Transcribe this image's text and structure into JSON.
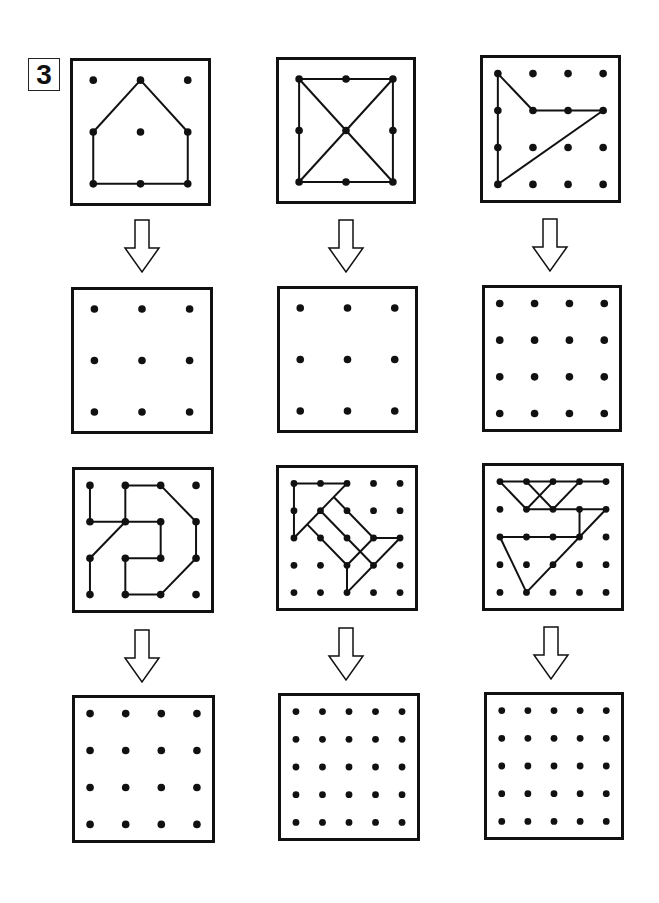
{
  "exercise": {
    "number": "3",
    "type": "geoboard copy exercise",
    "instructions_icon": "down-arrow-icon"
  },
  "colors": {
    "line": "#111111",
    "dot": "#111111",
    "background": "#ffffff"
  },
  "panels": [
    {
      "id": "source-1",
      "x": 70,
      "y": 58,
      "w": 141,
      "h": 148,
      "grid": 3,
      "lines": [
        [
          [
            1,
            0
          ],
          [
            0,
            1
          ]
        ],
        [
          [
            1,
            0
          ],
          [
            2,
            1
          ]
        ],
        [
          [
            0,
            1
          ],
          [
            0,
            2
          ]
        ],
        [
          [
            2,
            1
          ],
          [
            2,
            2
          ]
        ],
        [
          [
            0,
            2
          ],
          [
            2,
            2
          ]
        ]
      ]
    },
    {
      "id": "source-2",
      "x": 276,
      "y": 57,
      "w": 140,
      "h": 147,
      "grid": 3,
      "lines": [
        [
          [
            0,
            0
          ],
          [
            2,
            0
          ]
        ],
        [
          [
            0,
            0
          ],
          [
            0,
            2
          ]
        ],
        [
          [
            2,
            0
          ],
          [
            2,
            2
          ]
        ],
        [
          [
            0,
            2
          ],
          [
            2,
            2
          ]
        ],
        [
          [
            0,
            0
          ],
          [
            2,
            2
          ]
        ],
        [
          [
            2,
            0
          ],
          [
            0,
            2
          ]
        ]
      ]
    },
    {
      "id": "source-3",
      "x": 480,
      "y": 55,
      "w": 141,
      "h": 148,
      "grid": 4,
      "lines": [
        [
          [
            0,
            0
          ],
          [
            0,
            3
          ]
        ],
        [
          [
            0,
            0
          ],
          [
            1,
            1
          ]
        ],
        [
          [
            1,
            1
          ],
          [
            3,
            1
          ]
        ],
        [
          [
            3,
            1
          ],
          [
            0,
            3
          ]
        ]
      ]
    },
    {
      "id": "target-1",
      "x": 71,
      "y": 287,
      "w": 142,
      "h": 147,
      "grid": 3,
      "lines": []
    },
    {
      "id": "target-2",
      "x": 277,
      "y": 286,
      "w": 141,
      "h": 147,
      "grid": 3,
      "lines": []
    },
    {
      "id": "target-3",
      "x": 482,
      "y": 285,
      "w": 140,
      "h": 147,
      "grid": 4,
      "lines": []
    },
    {
      "id": "source-4",
      "x": 72,
      "y": 467,
      "w": 142,
      "h": 146,
      "grid": 4,
      "lines": [
        [
          [
            0,
            0
          ],
          [
            0,
            1
          ]
        ],
        [
          [
            0,
            1
          ],
          [
            2,
            1
          ]
        ],
        [
          [
            1,
            0
          ],
          [
            1,
            1
          ]
        ],
        [
          [
            1,
            0
          ],
          [
            2,
            0
          ]
        ],
        [
          [
            2,
            0
          ],
          [
            3,
            1
          ]
        ],
        [
          [
            3,
            1
          ],
          [
            3,
            2
          ]
        ],
        [
          [
            3,
            2
          ],
          [
            2,
            3
          ]
        ],
        [
          [
            2,
            3
          ],
          [
            1,
            3
          ]
        ],
        [
          [
            1,
            3
          ],
          [
            1,
            2
          ]
        ],
        [
          [
            1,
            2
          ],
          [
            2,
            2
          ]
        ],
        [
          [
            2,
            2
          ],
          [
            2,
            1
          ]
        ],
        [
          [
            1,
            1
          ],
          [
            0,
            2
          ]
        ],
        [
          [
            0,
            2
          ],
          [
            0,
            3
          ]
        ]
      ]
    },
    {
      "id": "source-5",
      "x": 276,
      "y": 465,
      "w": 142,
      "h": 146,
      "grid": 5,
      "lines": [
        [
          [
            0,
            0
          ],
          [
            2,
            0
          ]
        ],
        [
          [
            0,
            0
          ],
          [
            0,
            2
          ]
        ],
        [
          [
            0,
            2
          ],
          [
            2,
            0
          ]
        ],
        [
          [
            1.5,
            0.5
          ],
          [
            3,
            2
          ]
        ],
        [
          [
            1,
            1
          ],
          [
            3,
            3
          ]
        ],
        [
          [
            0.5,
            1.5
          ],
          [
            2,
            3
          ]
        ],
        [
          [
            3,
            2
          ],
          [
            4,
            2
          ]
        ],
        [
          [
            3,
            2
          ],
          [
            2,
            3
          ]
        ],
        [
          [
            4,
            2
          ],
          [
            2,
            4
          ]
        ],
        [
          [
            2,
            3
          ],
          [
            2,
            4
          ]
        ]
      ]
    },
    {
      "id": "source-6",
      "x": 482,
      "y": 463,
      "w": 142,
      "h": 148,
      "grid": 5,
      "lines": [
        [
          [
            0,
            0
          ],
          [
            4,
            0
          ]
        ],
        [
          [
            0,
            0
          ],
          [
            1,
            1
          ]
        ],
        [
          [
            1,
            0
          ],
          [
            2,
            1
          ]
        ],
        [
          [
            2,
            0
          ],
          [
            1,
            1
          ]
        ],
        [
          [
            3,
            0
          ],
          [
            2,
            1
          ]
        ],
        [
          [
            1,
            1
          ],
          [
            4,
            1
          ]
        ],
        [
          [
            3,
            1
          ],
          [
            3,
            2
          ]
        ],
        [
          [
            4,
            1
          ],
          [
            1,
            4
          ]
        ],
        [
          [
            0,
            2
          ],
          [
            3,
            2
          ]
        ],
        [
          [
            0,
            2
          ],
          [
            1,
            4
          ]
        ]
      ]
    },
    {
      "id": "target-4",
      "x": 72,
      "y": 695,
      "w": 143,
      "h": 148,
      "grid": 4,
      "lines": []
    },
    {
      "id": "target-5",
      "x": 278,
      "y": 693,
      "w": 142,
      "h": 148,
      "grid": 5,
      "lines": []
    },
    {
      "id": "target-6",
      "x": 484,
      "y": 692,
      "w": 140,
      "h": 148,
      "grid": 5,
      "lines": []
    }
  ],
  "arrows": [
    {
      "x": 122,
      "y": 218
    },
    {
      "x": 326,
      "y": 218
    },
    {
      "x": 530,
      "y": 217
    },
    {
      "x": 122,
      "y": 628
    },
    {
      "x": 326,
      "y": 626
    },
    {
      "x": 531,
      "y": 625
    }
  ]
}
